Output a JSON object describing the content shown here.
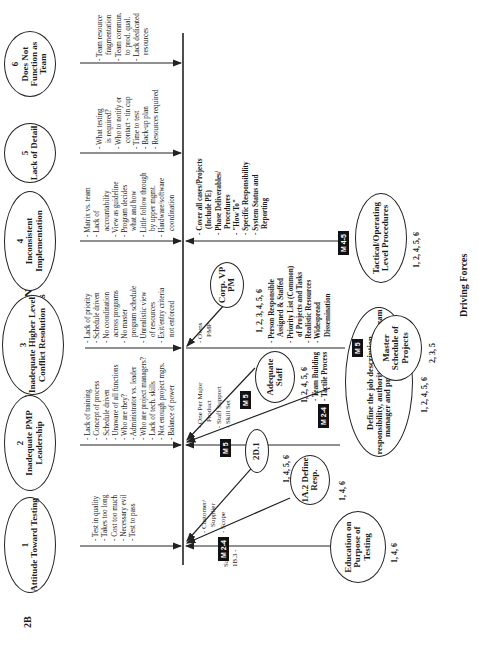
{
  "page_label": "2B",
  "title": "PMP/MANAGEMENT IS INADEQUATE",
  "restraining_heading": "Restraining Forces",
  "driving_heading": "Driving Forces",
  "restraining_forces": [
    {
      "num": "1",
      "label": "Attitude Toward Testing",
      "items": [
        "Test in quality",
        "Takes too long",
        "Cost too much",
        "Necessary evil",
        "Test to pass"
      ]
    },
    {
      "num": "2",
      "label": "Inadequate PMP Leadership",
      "items": [
        "Lack of training",
        "Concept of process",
        "Schedule driven",
        "Unaware of all functions",
        "Who are they?",
        "Administrator vs. leader",
        "Who are project managers?",
        "Lack of tech. skills",
        "Not enough project mgrs.",
        "Balance of power"
      ]
    },
    {
      "num": "3",
      "label": "Inadequate Higher Level Conflict Resolution",
      "items": [
        "Lack of priority",
        "Schedule driven",
        "No coordination",
        "across programs",
        "No master",
        "program schedule",
        "Unrealistic view",
        "of resources",
        "Exit/entry criteria",
        "not enforced"
      ]
    },
    {
      "num": "4",
      "label": "Inconsistent Implementation",
      "items": [
        "Matrix vs. team",
        "Lack of",
        "accountability",
        "View as guideline",
        "Program decides",
        "what and how",
        "Little follow through",
        "by upper mgmt.",
        "Hardware/software",
        "coordination"
      ]
    },
    {
      "num": "5",
      "label": "Lack of Detail",
      "items": [
        "What testing",
        "is required?",
        "Who to notify or",
        "contact - tin cup",
        "Time to test",
        "Back-up plan",
        "Resources required"
      ]
    },
    {
      "num": "6",
      "label": "Does Not Function as Team",
      "items": [
        "Team resource",
        "fragmentation",
        "Team commun.",
        "to prod. qual.",
        "Lack dedicated",
        "resources"
      ]
    }
  ],
  "driving_forces": {
    "education": {
      "label": "Education on Purpose of Testing",
      "nums": "1, 4, 6",
      "badge": "M 2-4",
      "side_note": [
        "Sales -",
        "1B.3 -"
      ]
    },
    "define_resp": {
      "label": "1A.2 Define Resp.",
      "nums": "1, 4, 6"
    },
    "d2_1": {
      "label": "2D.1",
      "nums": "1, 4, 5, 6"
    },
    "customer_notes": [
      "Customer/",
      "Supplier",
      "Scope"
    ],
    "job_description": {
      "label": "Define the job description, responsibility, authority, of the program manager and project manager",
      "nums": "1, 2, 4, 5, 6",
      "badge": "M 5"
    },
    "team_training": {
      "label": "Team Training",
      "nums": "1, 2, 4, 6",
      "badge": "M 2-4"
    },
    "adequate_staff": {
      "label": "Adequate Staff",
      "nums": "1, 2, 4, 5, 6",
      "badge": "M 5",
      "notes": [
        "Team Building",
        "Tactile Process"
      ]
    },
    "major_product_notes": [
      "One Per Major",
      "Product",
      "Staff Support",
      "Skill Set"
    ],
    "corp_vp": {
      "label": "Corp. VP PM",
      "nums": "1, 2, 3, 4, 5, 6",
      "notes": [
        "Owns",
        "PMP"
      ]
    },
    "master_schedule": {
      "label": "Master Schedule of Projects",
      "nums": "2, 3, 5",
      "badge": "M 5",
      "notes": [
        "Person Responsible",
        "Assigned & Staffed",
        "Priority List (Common)",
        "of Projects and Tasks",
        "Realistic Resources",
        "Widespread",
        "Dissemination"
      ]
    },
    "tactical": {
      "label": "Tactical/Operating Level Procedures",
      "nums": "1, 2, 4, 5, 6",
      "badge": "M 4-5",
      "notes": [
        "Cover all cases/Projects",
        "(Include PE)",
        "Phase Deliverables/",
        "Procedures",
        "\"How To\"",
        "Specific Responsibility",
        "System Status and",
        "Reporting"
      ]
    }
  }
}
